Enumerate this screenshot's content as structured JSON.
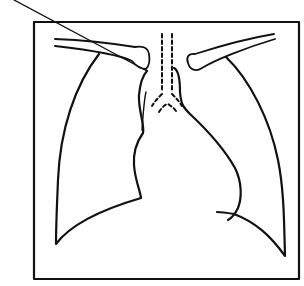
{
  "figure": {
    "type": "line-drawing",
    "colors": {
      "background": "#ffffff",
      "ink": "#111111"
    },
    "annotations": [
      {
        "id": "pointer-line",
        "description": "leader line from top-left pointing to right upper mediastinal border",
        "text": ""
      }
    ],
    "structures": [
      "frame",
      "right-clavicle",
      "left-clavicle",
      "trachea",
      "carina",
      "right-lung-outline",
      "left-lung-outline",
      "right-mediastinal-border",
      "left-heart-border",
      "superior-vena-cava-line",
      "left-hemidiaphragm"
    ]
  }
}
